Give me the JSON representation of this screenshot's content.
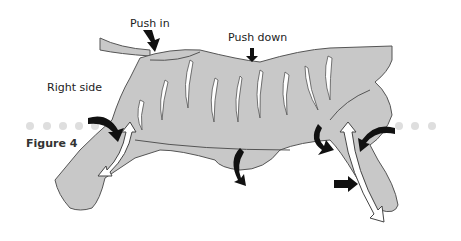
{
  "labels": {
    "push_in": "Push in",
    "push_down": "Push down",
    "right_side": "Right side",
    "figure": "Figure 4"
  },
  "colors": {
    "body_fill": "#c8c8c8",
    "outline": "#555555",
    "arrow_black": "#111111",
    "arrow_white": "#ffffff",
    "dots": "#dedede"
  },
  "dots": {
    "left_count": 5,
    "right_count": 3
  }
}
